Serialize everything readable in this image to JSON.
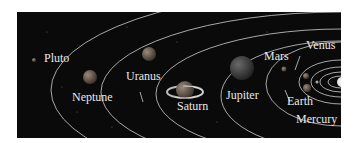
{
  "figure": {
    "background_color": "#0a0a0a",
    "orbit_color": "#cfcfcf",
    "label_color": "#e8e8e8"
  },
  "planets": [
    {
      "name": "Pluto"
    },
    {
      "name": "Neptune"
    },
    {
      "name": "Uranus"
    },
    {
      "name": "Saturn"
    },
    {
      "name": "Jupiter"
    },
    {
      "name": "Mars"
    },
    {
      "name": "Venus"
    },
    {
      "name": "Earth"
    },
    {
      "name": "Mercury"
    }
  ]
}
